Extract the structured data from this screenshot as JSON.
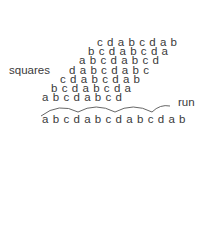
{
  "labels": {
    "left": "squares",
    "right": "run"
  },
  "staircase_rows": [
    "cdabcdab",
    "bcdabcda",
    "abcdabcd",
    "dabcdabc",
    "cdabcdab",
    "bcdabcda",
    "abcdabcd"
  ],
  "run_row": "abcdabcdabcdab",
  "arc_groups": [
    "abcd",
    "abcd",
    "abcd",
    "ab"
  ],
  "colors": {
    "text": "#3a3a3a",
    "arc": "#555555",
    "background": "#ffffff"
  }
}
